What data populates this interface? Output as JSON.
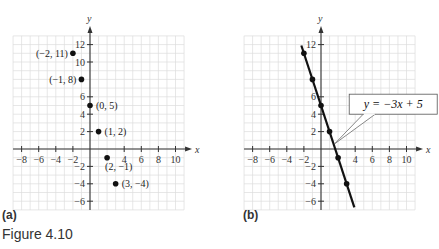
{
  "caption": "Figure 4.10",
  "panels": [
    {
      "label": "(a)"
    },
    {
      "label": "(b)"
    }
  ],
  "chart_data": [
    {
      "type": "scatter",
      "title": "(a)",
      "xlabel": "x",
      "ylabel": "y",
      "xlim": [
        -9,
        11
      ],
      "ylim": [
        -7,
        13
      ],
      "xticks": [
        -8,
        -6,
        -4,
        -2,
        4,
        6,
        8,
        10
      ],
      "yticks": [
        -6,
        -4,
        -2,
        2,
        4,
        6,
        10,
        12
      ],
      "grid": true,
      "points": [
        {
          "x": -2,
          "y": 11,
          "label": "(−2, 11)"
        },
        {
          "x": -1,
          "y": 8,
          "label": "(−1, 8)"
        },
        {
          "x": 0,
          "y": 5,
          "label": "(0, 5)"
        },
        {
          "x": 1,
          "y": 2,
          "label": "(1, 2)"
        },
        {
          "x": 2,
          "y": -1,
          "label": "(2, −1)"
        },
        {
          "x": 3,
          "y": -4,
          "label": "(3, −4)"
        }
      ]
    },
    {
      "type": "line",
      "title": "(b)",
      "xlabel": "x",
      "ylabel": "y",
      "xlim": [
        -9,
        11
      ],
      "ylim": [
        -7,
        13
      ],
      "xticks": [
        -8,
        -6,
        -4,
        -2,
        4,
        6,
        8,
        10
      ],
      "yticks": [
        -6,
        -4,
        -2,
        2,
        4,
        6,
        12
      ],
      "grid": true,
      "annotation": "y = −3x + 5",
      "equation": {
        "slope": -3,
        "intercept": 5
      },
      "points": [
        {
          "x": -2,
          "y": 11
        },
        {
          "x": -1,
          "y": 8
        },
        {
          "x": 0,
          "y": 5
        },
        {
          "x": 1,
          "y": 2
        },
        {
          "x": 2,
          "y": -1
        },
        {
          "x": 3,
          "y": -4
        }
      ],
      "line_extent": {
        "x_start": -2.3,
        "x_end": 3.9
      }
    }
  ]
}
